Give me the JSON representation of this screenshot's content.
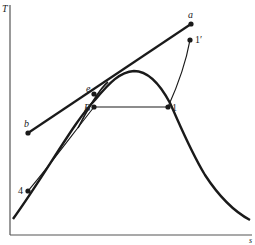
{
  "diagram": {
    "type": "T-s diagram",
    "axes": {
      "y_label": "T",
      "x_label": "s"
    },
    "points": [
      {
        "id": "a",
        "label": "a"
      },
      {
        "id": "1prime",
        "label": "1′"
      },
      {
        "id": "e",
        "label": "e"
      },
      {
        "id": "B",
        "label": "B"
      },
      {
        "id": "1",
        "label": "1"
      },
      {
        "id": "b",
        "label": "b"
      },
      {
        "id": "4",
        "label": "4"
      }
    ],
    "colors": {
      "line": "#1a1a1a",
      "axis": "#555555",
      "background": "#ffffff"
    }
  }
}
